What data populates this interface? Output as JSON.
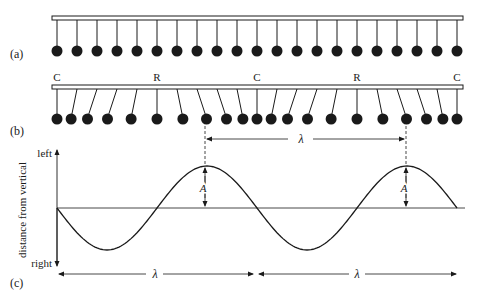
{
  "figure": {
    "panels": {
      "a": {
        "label": "(a)"
      },
      "b": {
        "label": "(b)",
        "markers": [
          {
            "text": "C",
            "x": 57
          },
          {
            "text": "R",
            "x": 157
          },
          {
            "text": "C",
            "x": 257
          },
          {
            "text": "R",
            "x": 357
          },
          {
            "text": "C",
            "x": 457
          }
        ]
      },
      "c": {
        "label": "(c)"
      }
    },
    "pendulums": {
      "count": 21,
      "first_x": 57,
      "spacing": 20,
      "displacement_amplitude": 10,
      "period_count": 10
    },
    "wavelength_label": "λ",
    "amplitude_label": "A",
    "axis": {
      "ylabel": "distance from vertical",
      "top_label": "left",
      "bottom_label": "right"
    },
    "colors": {
      "ink": "#1a1a1a",
      "bar_fill": "#ffffff"
    }
  },
  "chart_data": {
    "type": "line",
    "title": "",
    "xlabel": "",
    "ylabel": "distance from vertical",
    "y_direction_labels": {
      "positive": "left",
      "negative": "right"
    },
    "function": "y = -A*sin(2*pi*x/lambda)",
    "x_range_wavelengths": [
      0,
      2
    ],
    "annotations": [
      "A (amplitude)",
      "λ (wavelength)",
      "C (compression)",
      "R (rarefaction)"
    ],
    "grid": false
  }
}
